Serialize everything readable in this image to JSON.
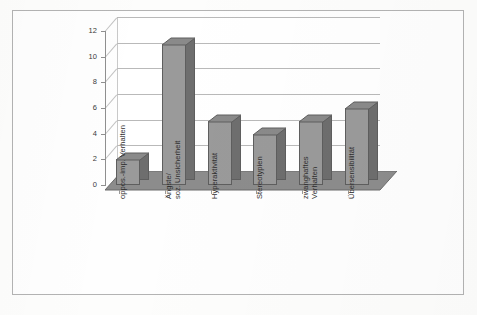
{
  "figure": {
    "border_color": "#b3b3b3",
    "background_color": "#fefefe"
  },
  "chart_data": {
    "type": "bar",
    "title": "",
    "subtitle": "",
    "xlabel": "",
    "ylabel": "",
    "ylim": [
      0,
      12
    ],
    "yticks": [
      0,
      2,
      4,
      6,
      8,
      10,
      12
    ],
    "grid": true,
    "legend": false,
    "three_d": true,
    "bar_face_color": "#9a9a9a",
    "bar_side_color": "#6e6e6e",
    "bar_edge_color": "#5e5e5e",
    "floor_color": "#8c8c8c",
    "categories": [
      "oppos.-imp. Verhalten",
      "Ängste/ soz. Unsicherheit",
      "Hyperaktivität",
      "Stereotypien",
      "zwanghaftes Verhalten",
      "Übersensibilität"
    ],
    "category_lines": [
      [
        "oppos.-imp. Verhalten"
      ],
      [
        "Ängste/",
        "soz. Unsicherheit"
      ],
      [
        "Hyperaktivität"
      ],
      [
        "Stereotypien"
      ],
      [
        "zwanghaftes",
        "Verhalten"
      ],
      [
        "Übersensibilität"
      ]
    ],
    "values": [
      2,
      11,
      5,
      4,
      5,
      6
    ]
  },
  "axis": {
    "tick_labels": [
      "12",
      "10",
      "8",
      "6",
      "4",
      "2",
      "0"
    ]
  }
}
